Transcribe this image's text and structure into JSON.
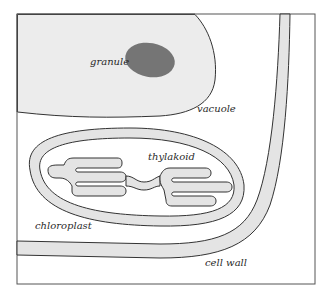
{
  "diagram": {
    "colors": {
      "frame": "#555555",
      "outline": "#333333",
      "vacuole_fill": "#ececec",
      "band_fill": "#e4e4e4",
      "granule_fill": "#757575",
      "background": "#ffffff"
    },
    "labels": {
      "granule": "granule",
      "vacuole": "vacuole",
      "thylakoid": "thylakoid",
      "chloroplast": "chloroplast",
      "cell_wall": "cell wall"
    }
  }
}
